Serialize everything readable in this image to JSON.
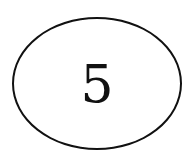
{
  "diagram": {
    "shape": "ellipse",
    "stroke_color": "#111111",
    "fill_color": "#ffffff",
    "label": "5"
  }
}
